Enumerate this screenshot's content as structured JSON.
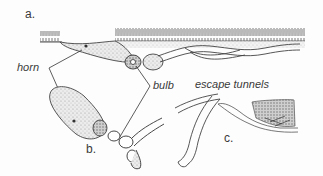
{
  "figure": {
    "panels": [
      {
        "id": "a",
        "label": "a."
      },
      {
        "id": "b",
        "label": "b."
      },
      {
        "id": "c",
        "label": "c."
      }
    ],
    "annotations": {
      "horn": "horn",
      "bulb": "bulb",
      "escape_tunnels": "escape tunnels"
    },
    "colors": {
      "ink": "#3a3a3a",
      "stipple": "#d6d6d6",
      "background": "#fdfdfd"
    }
  }
}
